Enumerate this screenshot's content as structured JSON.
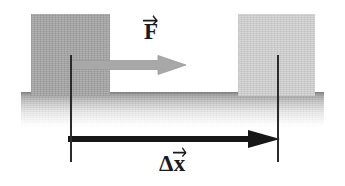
{
  "figure": {
    "background_color": "#ffffff"
  },
  "ground": {
    "name": "ground-surface",
    "color": "#9a9a9a"
  },
  "blocks": [
    {
      "name": "block-initial",
      "role": "initial position",
      "color": "#b0b0b0"
    },
    {
      "name": "block-final",
      "role": "final position",
      "color": "#d7d7d7"
    }
  ],
  "vectors": [
    {
      "id": "force",
      "symbol": "F",
      "prefix": "",
      "label": "F",
      "color": "#a0a0a0",
      "direction": "right"
    },
    {
      "id": "displacement",
      "symbol": "x",
      "prefix": "Δ",
      "label": "Δx",
      "color": "#1a1a1a",
      "direction": "right"
    }
  ],
  "reference_lines": [
    {
      "name": "ref-line-start",
      "color": "#2b2b2b"
    },
    {
      "name": "ref-line-end",
      "color": "#2b2b2b"
    }
  ]
}
